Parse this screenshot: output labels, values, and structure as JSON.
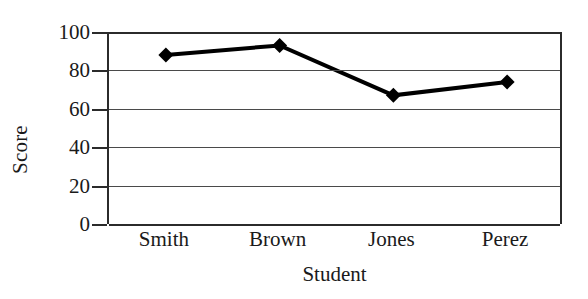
{
  "chart_data": {
    "type": "line",
    "title": "",
    "xlabel": "Student",
    "ylabel": "Score",
    "categories": [
      "Smith",
      "Brown",
      "Jones",
      "Perez"
    ],
    "values": [
      88,
      93,
      67,
      74
    ],
    "series": [
      {
        "name": "Score",
        "values": [
          88,
          93,
          67,
          74
        ],
        "color": "#000000",
        "marker": "diamond",
        "line_width": 4
      }
    ],
    "ylim": [
      0,
      100
    ],
    "y_ticks": [
      0,
      20,
      40,
      60,
      80,
      100
    ],
    "y_tick_labels": [
      "0",
      "20",
      "40",
      "60",
      "80",
      "100"
    ],
    "x_tick_labels": [
      "Smith",
      "Brown",
      "Jones",
      "Perez"
    ],
    "grid": true,
    "grid_axis": "y",
    "legend": false,
    "legend_position": "none",
    "background_color": "#ffffff",
    "axis_color": "#2b2b2b",
    "gridline_color": "#4a4a4a"
  }
}
